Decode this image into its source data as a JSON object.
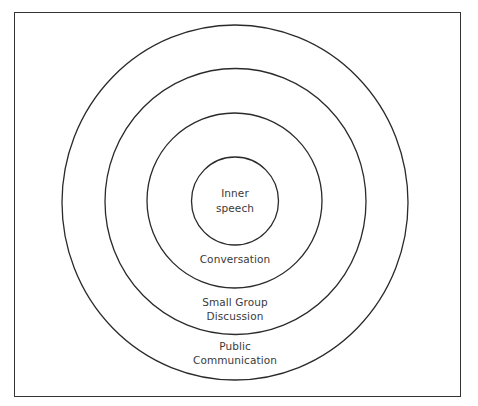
{
  "diagram": {
    "type": "concentric-circles",
    "rings": [
      {
        "id": "inner",
        "label_lines": [
          "Inner",
          "speech"
        ]
      },
      {
        "id": "conversation",
        "label_lines": [
          "Conversation"
        ]
      },
      {
        "id": "small-group",
        "label_lines": [
          "Small Group",
          "Discussion"
        ]
      },
      {
        "id": "public",
        "label_lines": [
          "Public",
          "Communication"
        ]
      }
    ],
    "stroke_color": "#2a2a2a",
    "text_color": "#3a3a3a"
  }
}
